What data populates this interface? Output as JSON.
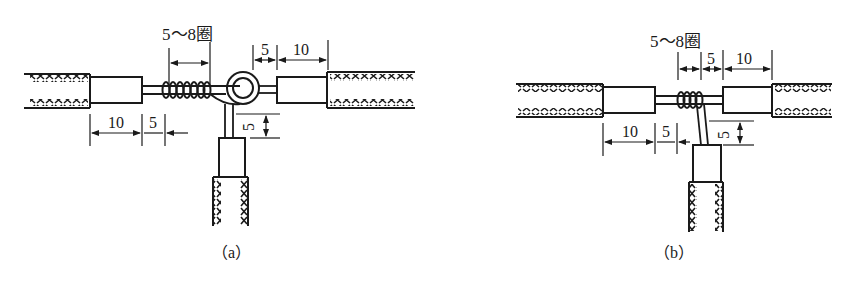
{
  "figure": {
    "panels": [
      {
        "id": "a",
        "caption": "（a）",
        "turns_label": "5～8圈",
        "dim_top_5": "5",
        "dim_top_10": "10",
        "dim_bottom_10": "10",
        "dim_bottom_5": "5",
        "dim_side_5": "5",
        "joint_type": "wrap with knot loop"
      },
      {
        "id": "b",
        "caption": "（b）",
        "turns_label": "5～8圈",
        "dim_top_5": "5",
        "dim_top_10": "10",
        "dim_bottom_10": "10",
        "dim_bottom_5": "5",
        "dim_side_5": "5",
        "joint_type": "simple wrap"
      }
    ],
    "colors": {
      "line": "#1a1a1a",
      "background": "#ffffff"
    }
  }
}
